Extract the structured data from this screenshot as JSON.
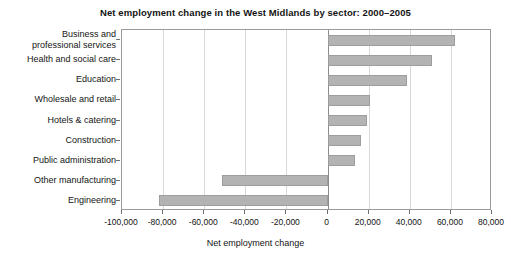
{
  "chart_data": {
    "type": "bar",
    "orientation": "horizontal",
    "title": "Net employment change in the West Midlands by sector: 2000–2005",
    "xlabel": "Net employment change",
    "ylabel": "",
    "xlim": [
      -100000,
      80000
    ],
    "xticks": [
      -100000,
      -80000,
      -60000,
      -40000,
      -20000,
      0,
      20000,
      40000,
      60000,
      80000
    ],
    "xtick_labels": [
      "-100,000",
      "-80,000",
      "-60,000",
      "-40,000",
      "-20,000",
      "0",
      "20,000",
      "40,000",
      "60,000",
      "80,000"
    ],
    "grid": true,
    "grid_axis": "x",
    "legend": false,
    "bar_color": "#b3b3b3",
    "bar_edge_color": "#9d9d9d",
    "categories": [
      "Business and professional services",
      "Health and social care",
      "Education",
      "Wholesale and retail",
      "Hotels & catering",
      "Construction",
      "Public administration",
      "Other manufacturing",
      "Engineering"
    ],
    "category_label_lines": [
      [
        "Business and",
        "professional services"
      ],
      [
        "Health and social care"
      ],
      [
        "Education"
      ],
      [
        "Wholesale and retail"
      ],
      [
        "Hotels & catering"
      ],
      [
        "Construction"
      ],
      [
        "Public administration"
      ],
      [
        "Other manufacturing"
      ],
      [
        "Engineering"
      ]
    ],
    "values": [
      62000,
      51000,
      38500,
      20500,
      19000,
      16500,
      13500,
      -51500,
      -82000
    ]
  }
}
